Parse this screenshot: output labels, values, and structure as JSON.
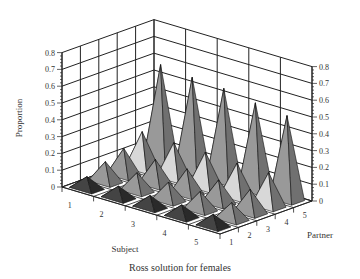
{
  "chart_data": {
    "type": "bar3d",
    "title": "Ross solution for females",
    "xlabel": "Subject",
    "ylabel": "Partner",
    "zlabel": "Proportion",
    "x_ticks": [
      "1",
      "2",
      "3",
      "4",
      "5"
    ],
    "y_ticks": [
      "1",
      "2",
      "3",
      "4",
      "5"
    ],
    "z_ticks": [
      "0",
      "0.1",
      "0.2",
      "0.3",
      "0.4",
      "0.5",
      "0.6",
      "0.7",
      "0.8"
    ],
    "zlim": [
      0,
      0.8
    ],
    "grid": true,
    "marker": "pyramid",
    "subjects": [
      1,
      2,
      3,
      4,
      5
    ],
    "partners": [
      1,
      2,
      3,
      4,
      5
    ],
    "values": [
      [
        0.07,
        0.12,
        0.16,
        0.22,
        0.58
      ],
      [
        0.07,
        0.11,
        0.15,
        0.21,
        0.56
      ],
      [
        0.07,
        0.11,
        0.15,
        0.21,
        0.55
      ],
      [
        0.07,
        0.11,
        0.14,
        0.2,
        0.52
      ],
      [
        0.07,
        0.1,
        0.14,
        0.2,
        0.5
      ]
    ],
    "values_note": "rows = subject 1..5, columns = partner 1..5"
  },
  "labels": {
    "caption": "Ross solution for females",
    "subject_axis": "Subject",
    "partner_axis": "Partner",
    "proportion_axis": "Proportion"
  }
}
